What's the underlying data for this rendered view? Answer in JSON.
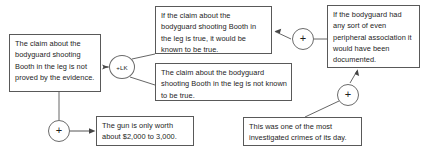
{
  "diagram": {
    "type": "argument-map",
    "boxes": [
      {
        "id": "not-proved",
        "text": "The claim about the bodyguard shooting Booth in the leg is not proved by the evidence."
      },
      {
        "id": "would-be-known",
        "text": "If the claim about the bodyguard shooting Booth in the leg is true, it would be known to be true."
      },
      {
        "id": "not-known",
        "text": "The claim about the bodyguard shooting Booth in the leg is not known to be true."
      },
      {
        "id": "peripheral-association",
        "text": "If the bodyguard had any sort of even peripheral association it would have been documented."
      },
      {
        "id": "gun-worth",
        "text": "The gun is only worth about $2,000 to 3,000."
      },
      {
        "id": "investigated-crime",
        "text": "This was one of the most investigated crimes of its day."
      }
    ],
    "nodes": [
      {
        "id": "lk",
        "label": "+LK"
      },
      {
        "id": "plus-top",
        "label": "+"
      },
      {
        "id": "plus-mid",
        "label": "+"
      },
      {
        "id": "plus-bottom",
        "label": "+"
      }
    ],
    "colors": {
      "box_border": "#595959",
      "node_border": "#6b6b6b",
      "edge": "#555555",
      "background": "#ffffff",
      "text": "#1d1d1d"
    }
  }
}
